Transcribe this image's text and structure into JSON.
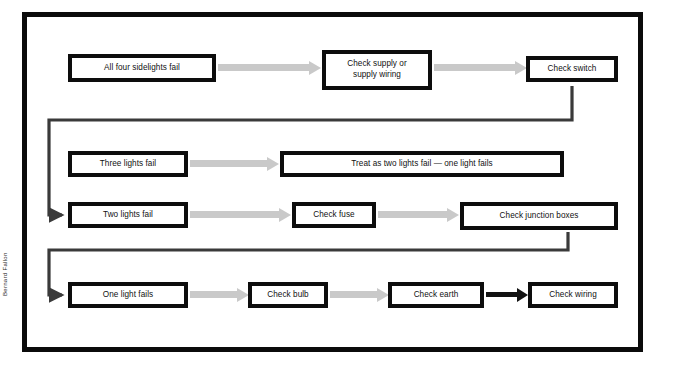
{
  "diagram": {
    "credit": "Bernard Fallon",
    "colors": {
      "frame": "#0b0b0b",
      "box_border": "#0d0d0d",
      "box_fill": "#ffffff",
      "arrow_light": "#c9c9c9",
      "arrow_dark": "#121212",
      "text": "#111111"
    },
    "rows": [
      {
        "id": "row-all-four",
        "nodes": [
          {
            "id": "all-four-sidelights-fail",
            "label": "All four sidelights fail"
          },
          {
            "id": "check-supply-or-supply-wiring",
            "label_line1": "Check supply or",
            "label_line2": "supply wiring"
          },
          {
            "id": "check-switch",
            "label": "Check switch"
          }
        ]
      },
      {
        "id": "row-three-lights",
        "nodes": [
          {
            "id": "three-lights-fail",
            "label": "Three lights fail"
          },
          {
            "id": "treat-as-two-lights-fail",
            "label": "Treat as two lights fail — one light fails"
          }
        ]
      },
      {
        "id": "row-two-lights",
        "nodes": [
          {
            "id": "two-lights-fail",
            "label": "Two lights fail"
          },
          {
            "id": "check-fuse",
            "label": "Check fuse"
          },
          {
            "id": "check-junction-boxes",
            "label": "Check junction boxes"
          }
        ]
      },
      {
        "id": "row-one-light",
        "nodes": [
          {
            "id": "one-light-fails",
            "label": "One light fails"
          },
          {
            "id": "check-bulb",
            "label": "Check bulb"
          },
          {
            "id": "check-earth",
            "label": "Check earth"
          },
          {
            "id": "check-wiring",
            "label": "Check wiring"
          }
        ]
      }
    ],
    "connectors": [
      {
        "id": "arrow-all-four-to-check-supply",
        "style": "light",
        "from": "all-four-sidelights-fail",
        "to": "check-supply-or-supply-wiring"
      },
      {
        "id": "arrow-check-supply-to-check-switch",
        "style": "light",
        "from": "check-supply-or-supply-wiring",
        "to": "check-switch"
      },
      {
        "id": "route-check-switch-to-two-lights-fail",
        "style": "dark-elbow",
        "from": "check-switch",
        "to": "two-lights-fail"
      },
      {
        "id": "arrow-three-lights-to-treat-as-two",
        "style": "light",
        "from": "three-lights-fail",
        "to": "treat-as-two-lights-fail"
      },
      {
        "id": "arrow-two-lights-to-check-fuse",
        "style": "light",
        "from": "two-lights-fail",
        "to": "check-fuse"
      },
      {
        "id": "arrow-check-fuse-to-check-junction-boxes",
        "style": "light",
        "from": "check-fuse",
        "to": "check-junction-boxes"
      },
      {
        "id": "route-check-junction-boxes-to-one-light-fails",
        "style": "dark-elbow",
        "from": "check-junction-boxes",
        "to": "one-light-fails"
      },
      {
        "id": "arrow-one-light-to-check-bulb",
        "style": "light",
        "from": "one-light-fails",
        "to": "check-bulb"
      },
      {
        "id": "arrow-check-bulb-to-check-earth",
        "style": "light",
        "from": "check-bulb",
        "to": "check-earth"
      },
      {
        "id": "arrow-check-earth-to-check-wiring",
        "style": "dark",
        "from": "check-earth",
        "to": "check-wiring"
      }
    ]
  }
}
